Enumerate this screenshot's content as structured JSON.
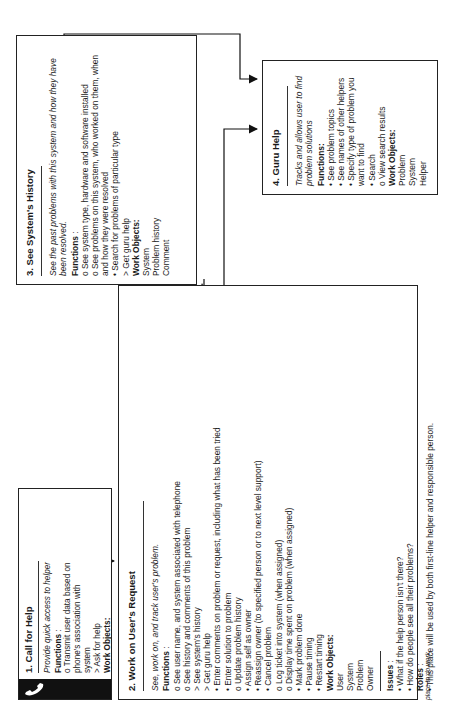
{
  "box1": {
    "title": "1. Call for Help",
    "description": "Provide quick access to helper",
    "functions_label": "Functions",
    "functions_suffix": " :",
    "functions": [
      "o  Transmit user data based on phone's association with system",
      "> Ask for help"
    ],
    "work_objects_label": "Work Objects:",
    "work_objects": [
      "Associated system",
      "User"
    ],
    "constraints_label": "Constraints",
    "constraints_suffix": " :",
    "constraints": [
      "• This is a telephone; must designate a button for help.",
      "• Need to integrate database of users, history, and phone numbers."
    ],
    "icon": "telephone-icon"
  },
  "box2": {
    "title": "2. Work on User's Request",
    "description": "See, work on, and track user's problem.",
    "functions_label": "Functions",
    "functions_suffix": " :",
    "functions": [
      "o  See user name, and system associated with telephone",
      "o  See history and comments of this problem",
      ">  See system's history",
      ">  Get guru help",
      "•  Enter comments on problem or request, including what has been tried",
      "•  Enter solution to problem",
      "o  Update problem history",
      "•  Assign self as owner",
      "•  Reassign owner (to specified person or to next level support)",
      "•  Cancel problem",
      "o  Log ticket into system (when assigned)",
      "o  Display time spent on problem (when assigned)",
      "•  Mark problem done",
      "•  Pause timing",
      "•  Restart timing"
    ],
    "work_objects_label": "Work Objects:",
    "work_objects": [
      "User",
      "System",
      "Problem",
      "Owner"
    ],
    "issues_label": "Issues",
    "issues_suffix": " :",
    "issues": [
      "•  What if the help person isn't there?",
      "•  How do people see all their problems?"
    ],
    "roles_label": "Roles",
    "roles_suffix": " :",
    "roles": [
      "•  This place will be used by both first-line helper and responsible person."
    ]
  },
  "box3": {
    "title": "3. See System's History",
    "description": "See the past problems with this system and how they have been resolved.",
    "functions_label": "Functions",
    "functions_suffix": " :",
    "functions": [
      "o  See system type, hardware and software installed",
      "o  See problems on this system, who worked on them, when and how they were resolved",
      "•  Search for problems of particular type",
      ">  Get guru help"
    ],
    "work_objects_label": "Work Objects:",
    "work_objects": [
      "System",
      "Problem history",
      "Comment"
    ]
  },
  "box4": {
    "title": "4. Guru Help",
    "description": "Tracks and  allows user to find problem solutions",
    "functions_label": "Functions:",
    "functions": [
      "•  See problem topics",
      "•  See names of other helpers",
      "•  Specify type of problem you want to find",
      "•  Search",
      "o  View search results"
    ],
    "work_objects_label": "Work Objects:",
    "work_objects": [
      "Problem",
      "System",
      "Helper"
    ]
  },
  "legend": {
    "flow": "flow to another place",
    "function": "function",
    "automatic": "automatic function",
    "place": "place to do work"
  }
}
